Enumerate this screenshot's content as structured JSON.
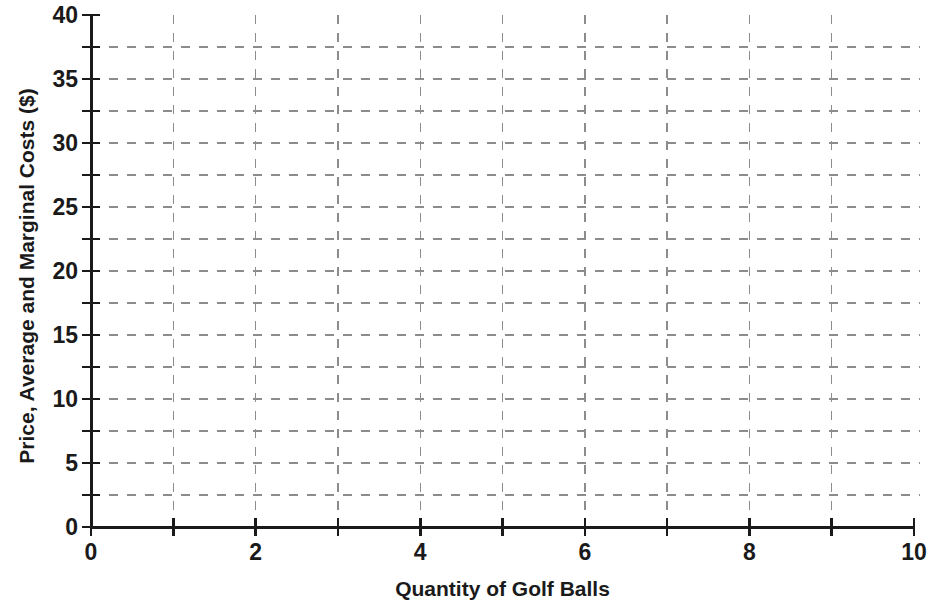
{
  "chart_data": {
    "type": "line",
    "title": "",
    "subtitle": "",
    "xlabel": "Quantity of Golf Balls",
    "ylabel": "Price, Average and Marginal Costs ($)",
    "xlim": [
      0,
      10
    ],
    "ylim": [
      0,
      40
    ],
    "x_tick_labels": [
      "0",
      "2",
      "4",
      "6",
      "8",
      "10"
    ],
    "x_tick_values": [
      0,
      2,
      4,
      6,
      8,
      10
    ],
    "x_minor_tick_values": [
      0,
      1,
      2,
      3,
      4,
      5,
      6,
      7,
      8,
      9,
      10
    ],
    "y_tick_labels": [
      "0",
      "5",
      "10",
      "15",
      "20",
      "25",
      "30",
      "35",
      "40"
    ],
    "y_tick_values": [
      0,
      5,
      10,
      15,
      20,
      25,
      30,
      35,
      40
    ],
    "y_minor_tick_values": [
      0,
      2.5,
      5,
      7.5,
      10,
      12.5,
      15,
      17.5,
      20,
      22.5,
      25,
      27.5,
      30,
      32.5,
      35,
      37.5,
      40
    ],
    "grid": {
      "enabled": true,
      "style": "dashed",
      "color": "#8c8c8c",
      "vertical_lines_at_x": [
        1,
        2,
        3,
        4,
        5,
        6,
        7,
        8,
        9
      ],
      "horizontal_lines_at_y": [
        2.5,
        5,
        7.5,
        10,
        12.5,
        15,
        17.5,
        20,
        22.5,
        25,
        27.5,
        30,
        32.5,
        35,
        37.5
      ]
    },
    "legend": {
      "position": "none",
      "entries": []
    },
    "series": [],
    "annotations": [],
    "axis_color": "#1a1a1a",
    "background_color": "#ffffff"
  }
}
